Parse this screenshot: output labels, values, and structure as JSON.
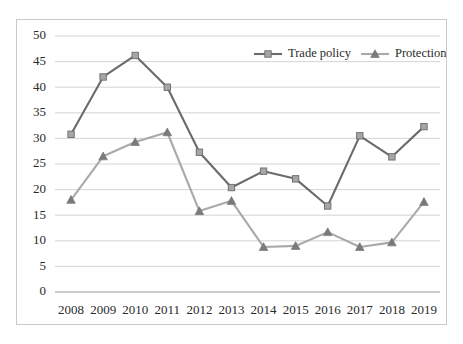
{
  "chart_data": {
    "type": "line",
    "title": "",
    "xlabel": "",
    "ylabel": "",
    "categories": [
      "2008",
      "2009",
      "2010",
      "2011",
      "2012",
      "2013",
      "2014",
      "2015",
      "2016",
      "2017",
      "2018",
      "2019"
    ],
    "ylim": [
      0,
      50
    ],
    "ytick_step": 5,
    "yticks": [
      "0",
      "5",
      "10",
      "15",
      "20",
      "25",
      "30",
      "35",
      "40",
      "45",
      "50"
    ],
    "grid": "horizontal",
    "legend_position": "top-right-inside",
    "series": [
      {
        "name": "Trade policy",
        "color": "#6b6b6b",
        "marker": "square",
        "marker_color": "#a6a6a6",
        "values": [
          30.8,
          42.0,
          46.2,
          40.0,
          27.3,
          20.4,
          23.6,
          22.1,
          16.8,
          30.5,
          26.4,
          32.3
        ]
      },
      {
        "name": "Protectionism",
        "color": "#a9a9a9",
        "marker": "triangle",
        "marker_color": "#7a7a7a",
        "values": [
          18.0,
          26.5,
          29.3,
          31.2,
          15.8,
          17.8,
          8.8,
          9.0,
          11.7,
          8.8,
          9.7,
          17.6
        ]
      }
    ]
  },
  "legend": {
    "items": [
      {
        "label": "Trade policy"
      },
      {
        "label": "Protectionism"
      }
    ]
  },
  "colors": {
    "trade_policy_line": "#6b6b6b",
    "trade_policy_marker": "#a6a6a6",
    "protectionism_line": "#a9a9a9",
    "protectionism_marker": "#7a7a7a",
    "gridline": "#d4d4d4",
    "border": "#c9c9c9",
    "text": "#2b2b2b"
  }
}
